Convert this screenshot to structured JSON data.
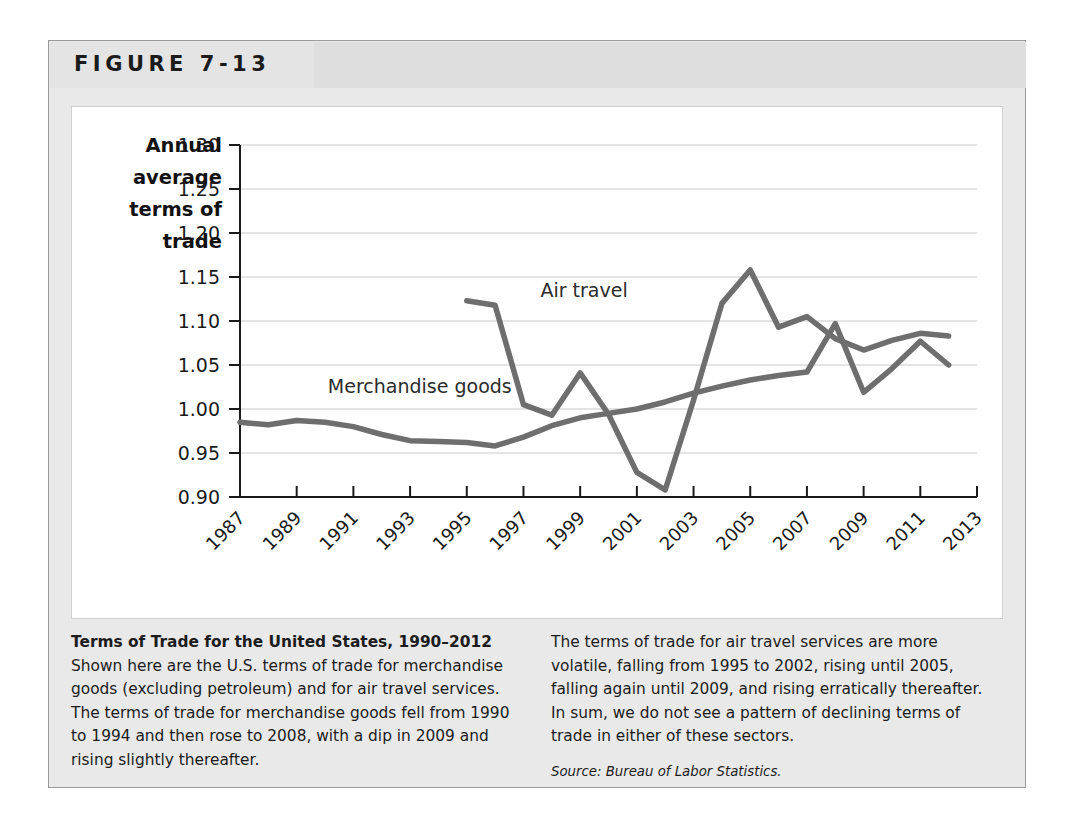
{
  "figure": {
    "label": "FIGURE 7-13"
  },
  "caption": {
    "title": "Terms of Trade for the United States, 1990–2012",
    "left_body": " Shown here are the U.S. terms of trade for merchandise goods (excluding petroleum) and for air travel services. The terms of trade for merchandise goods fell from 1990 to 1994 and then rose to 2008, with a dip in 2009 and rising slightly thereafter.",
    "right_body": "The terms of trade for air travel services are more volatile, falling from 1995 to 2002, rising until 2005, falling again until 2009, and rising erratically thereafter. In sum, we do not see a pattern of declining terms of trade in either of these sectors.",
    "source": "Source: Bureau of Labor Statistics."
  },
  "chart_data": {
    "type": "line",
    "title": "",
    "xlabel": "",
    "ylabel": "Annual average terms of trade",
    "ylabel_lines": [
      "Annual",
      "average",
      "terms of",
      "trade"
    ],
    "xlim": [
      1987,
      2013
    ],
    "ylim": [
      0.9,
      1.3
    ],
    "grid": true,
    "legend": "inline-labels",
    "ytick_labels": [
      "1.30",
      "1.25",
      "1.20",
      "1.15",
      "1.10",
      "1.05",
      "1.00",
      "0.95",
      "0.90"
    ],
    "ytick_values": [
      1.3,
      1.25,
      1.2,
      1.15,
      1.1,
      1.05,
      1.0,
      0.95,
      0.9
    ],
    "xtick_labels": [
      "1987",
      "1989",
      "1991",
      "1993",
      "1995",
      "1997",
      "1999",
      "2001",
      "2003",
      "2005",
      "2007",
      "2009",
      "2011",
      "2013"
    ],
    "xtick_values": [
      1987,
      1989,
      1991,
      1993,
      1995,
      1997,
      1999,
      2001,
      2003,
      2005,
      2007,
      2009,
      2011,
      2013
    ],
    "series": [
      {
        "name": "Merchandise goods",
        "color": "#6e6e6e",
        "label_x": 1990.1,
        "label_y": 1.018,
        "x": [
          1987,
          1988,
          1989,
          1990,
          1991,
          1992,
          1993,
          1994,
          1995,
          1996,
          1997,
          1998,
          1999,
          2000,
          2001,
          2002,
          2003,
          2004,
          2005,
          2006,
          2007,
          2008,
          2009,
          2010,
          2011,
          2012
        ],
        "values": [
          0.985,
          0.982,
          0.987,
          0.985,
          0.98,
          0.971,
          0.964,
          0.963,
          0.962,
          0.958,
          0.968,
          0.981,
          0.99,
          0.995,
          1.0,
          1.008,
          1.018,
          1.026,
          1.033,
          1.038,
          1.042,
          1.097,
          1.019,
          1.046,
          1.077,
          1.05
        ]
      },
      {
        "name": "Air travel",
        "color": "#6e6e6e",
        "label_x": 1997.6,
        "label_y": 1.127,
        "x": [
          1995,
          1996,
          1997,
          1998,
          1999,
          2000,
          2001,
          2002,
          2003,
          2004,
          2005,
          2006,
          2007,
          2008,
          2009,
          2010,
          2011,
          2012
        ],
        "values": [
          1.123,
          1.118,
          1.005,
          0.993,
          1.041,
          0.994,
          0.928,
          0.908,
          1.01,
          1.12,
          1.158,
          1.093,
          1.105,
          1.08,
          1.067,
          1.078,
          1.086,
          1.083
        ]
      }
    ]
  }
}
